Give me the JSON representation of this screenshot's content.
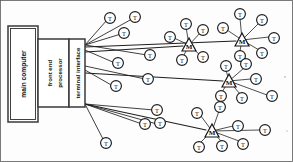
{
  "figure": {
    "width": 293,
    "height": 162,
    "style": "scanned line drawing, black ink on white paper",
    "colors": {
      "ink": "#1a1a1a",
      "paper": "#fdfdfd",
      "frame": "#5a5a5a"
    }
  },
  "boxes": [
    {
      "id": "main-computer",
      "label": "main computer",
      "label_orientation": "vertical-bottom-to-top",
      "x": 8,
      "y": 26,
      "w": 30,
      "h": 96
    },
    {
      "id": "front-end-processor",
      "label": "front end processor",
      "label_line_1": "front end",
      "label_line_2": "processor",
      "label_orientation": "vertical-bottom-to-top",
      "x": 38,
      "y": 39,
      "w": 31,
      "h": 68
    },
    {
      "id": "terminal-interface",
      "label": "terminal interface",
      "label_orientation": "vertical-bottom-to-top",
      "x": 69,
      "y": 39,
      "w": 16,
      "h": 68
    }
  ],
  "multiplexers": [
    {
      "id": "mux-1",
      "label": "M",
      "cx": 189,
      "cy": 45,
      "terminal_count": 5
    },
    {
      "id": "mux-2",
      "label": "M",
      "cx": 242,
      "cy": 40,
      "terminal_count": 6
    },
    {
      "id": "mux-3",
      "label": "M",
      "cx": 229,
      "cy": 81,
      "terminal_count": 6
    },
    {
      "id": "mux-4",
      "label": "M",
      "cx": 212,
      "cy": 131,
      "terminal_count": 7
    }
  ],
  "terminal_label": "T",
  "direct_terminals": [
    {
      "cx": 110,
      "cy": 18
    },
    {
      "cx": 135,
      "cy": 17
    },
    {
      "cx": 124,
      "cy": 33
    },
    {
      "cx": 150,
      "cy": 55
    },
    {
      "cx": 118,
      "cy": 63
    },
    {
      "cx": 148,
      "cy": 79
    },
    {
      "cx": 116,
      "cy": 86
    },
    {
      "cx": 157,
      "cy": 110
    },
    {
      "cx": 145,
      "cy": 124
    },
    {
      "cx": 160,
      "cy": 123
    },
    {
      "cx": 106,
      "cy": 143
    }
  ],
  "mux_terminals": {
    "mux-1": [
      {
        "cx": 186,
        "cy": 24
      },
      {
        "cx": 203,
        "cy": 30
      },
      {
        "cx": 170,
        "cy": 37
      },
      {
        "cx": 182,
        "cy": 60
      },
      {
        "cx": 203,
        "cy": 57
      }
    ],
    "mux-2": [
      {
        "cx": 240,
        "cy": 14
      },
      {
        "cx": 262,
        "cy": 20
      },
      {
        "cx": 223,
        "cy": 28
      },
      {
        "cx": 274,
        "cy": 38
      },
      {
        "cx": 240,
        "cy": 56
      },
      {
        "cx": 262,
        "cy": 53
      }
    ],
    "mux-3": [
      {
        "cx": 226,
        "cy": 66
      },
      {
        "cx": 246,
        "cy": 64
      },
      {
        "cx": 256,
        "cy": 79
      },
      {
        "cx": 221,
        "cy": 96
      },
      {
        "cx": 242,
        "cy": 98
      },
      {
        "cx": 272,
        "cy": 96
      }
    ],
    "mux-4": [
      {
        "cx": 220,
        "cy": 107
      },
      {
        "cx": 197,
        "cy": 113
      },
      {
        "cx": 238,
        "cy": 126
      },
      {
        "cx": 265,
        "cy": 130
      },
      {
        "cx": 199,
        "cy": 147
      },
      {
        "cx": 222,
        "cy": 146
      },
      {
        "cx": 243,
        "cy": 144
      }
    ]
  },
  "fanout_points": [
    {
      "id": "upper-fanout",
      "x": 85,
      "y": 45
    },
    {
      "id": "lower-fanout",
      "x": 85,
      "y": 104
    }
  ]
}
